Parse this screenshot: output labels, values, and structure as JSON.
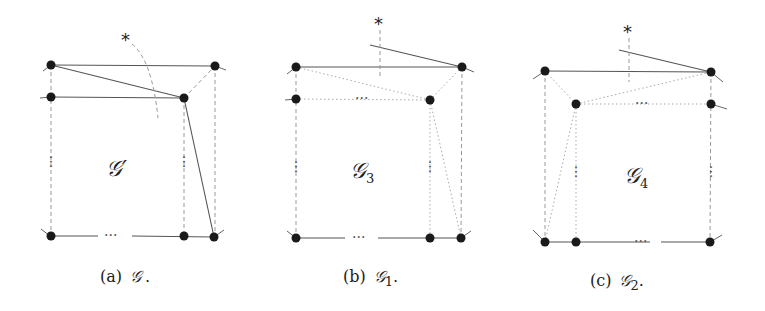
{
  "panels": [
    {
      "id": "a",
      "caption_prefix": "(a)",
      "caption_symbol": "𝒢",
      "caption_sub": "",
      "caption_suffix": ".",
      "inner_label": "𝒢′",
      "inner_sub": "",
      "marker": "*",
      "ellipsis": "···"
    },
    {
      "id": "b",
      "caption_prefix": "(b)",
      "caption_symbol": "𝒢",
      "caption_sub": "1",
      "caption_suffix": ".",
      "inner_label": "𝒢",
      "inner_sub": "3",
      "marker": "*",
      "ellipsis": "···"
    },
    {
      "id": "c",
      "caption_prefix": "(c)",
      "caption_symbol": "𝒢",
      "caption_sub": "2",
      "caption_suffix": ".",
      "inner_label": "𝒢",
      "inner_sub": "4",
      "marker": "*",
      "ellipsis": "···"
    }
  ]
}
